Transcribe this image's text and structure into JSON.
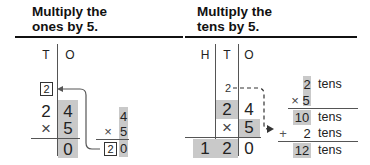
{
  "left": {
    "heading_line1": "Multiply the",
    "heading_line2": "ones by 5.",
    "columns": [
      "T",
      "O"
    ],
    "carry": "2",
    "top": [
      "2",
      "4"
    ],
    "op": "×",
    "multiplier": "5",
    "result_ones": "0",
    "side": {
      "top": "4",
      "op": "×",
      "mult": "5",
      "carry": "2",
      "ones": "0"
    }
  },
  "right": {
    "heading_line1": "Multiply the",
    "heading_line2": "tens by 5.",
    "columns": [
      "H",
      "T",
      "O"
    ],
    "carry": "2",
    "top": [
      "2",
      "4"
    ],
    "op": "×",
    "multiplier": "5",
    "result": [
      "1",
      "2",
      "0"
    ],
    "side": {
      "r1": {
        "num": "2",
        "unit": "tens"
      },
      "r2": {
        "op": "×",
        "num": "5"
      },
      "r3": {
        "num": "10",
        "unit": "tens"
      },
      "r4": {
        "op": "+",
        "num": "2",
        "unit": "tens"
      },
      "r5": {
        "num": "12",
        "unit": "tens"
      }
    }
  }
}
